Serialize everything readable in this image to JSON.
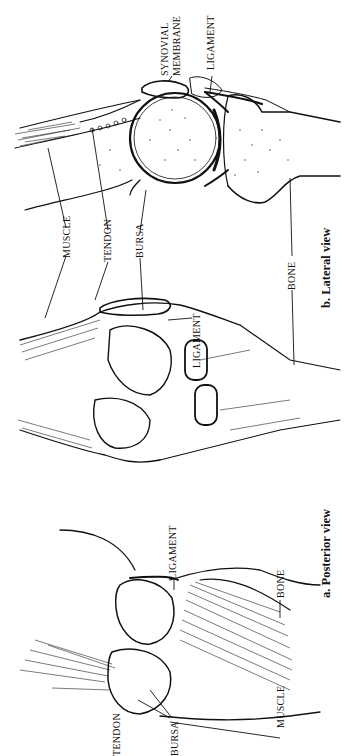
{
  "figure": {
    "orientation": "rotated-90-clockwise",
    "panels": [
      {
        "id": "a",
        "caption": "a.  Posterior view",
        "labels": {
          "tendon": "TENDON",
          "bursa": "BURSA",
          "ligament": "LIGAMENT",
          "muscle": "MUSCLE",
          "bone": "BONE"
        }
      },
      {
        "id": "b",
        "caption": "b.  Lateral view",
        "labels": {
          "muscle": "MUSCLE",
          "tendon": "TENDON",
          "bursa": "BURSA",
          "ligament_side": "LIGAMENT",
          "bone": "BONE",
          "synovial_line1": "SYNOVIAL",
          "synovial_line2": "MEMBRANE",
          "ligament_top": "LIGAMENT"
        }
      }
    ]
  }
}
